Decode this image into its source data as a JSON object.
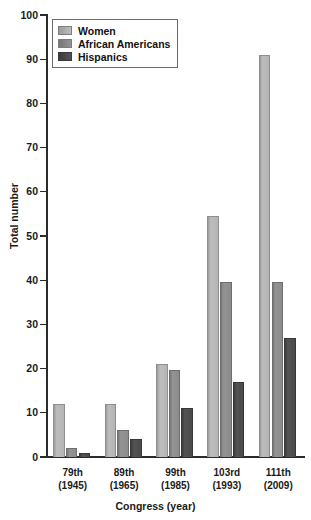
{
  "title_fragment": "",
  "chart_data": {
    "type": "bar",
    "title": "",
    "xlabel": "Congress (year)",
    "ylabel": "Total number",
    "ylim": [
      0,
      100
    ],
    "ytick_step": 10,
    "yticks": [
      0,
      10,
      20,
      30,
      40,
      50,
      60,
      70,
      80,
      90,
      100
    ],
    "grid": false,
    "legend_position": "top-left",
    "categories": [
      "79th (1945)",
      "89th (1965)",
      "99th (1985)",
      "103rd (1993)",
      "111th (2009)"
    ],
    "category_lines": [
      [
        "79th",
        "(1945)"
      ],
      [
        "89th",
        "(1965)"
      ],
      [
        "99th",
        "(1985)"
      ],
      [
        "103rd",
        "(1993)"
      ],
      [
        "111th",
        "(2009)"
      ]
    ],
    "series": [
      {
        "name": "Women",
        "color": "#b4b4b4",
        "values": [
          12,
          12,
          21,
          54.5,
          91
        ]
      },
      {
        "name": "African Americans",
        "color": "#8b8b8b",
        "values": [
          2,
          6,
          19.7,
          39.5,
          39.5
        ]
      },
      {
        "name": "Hispanics",
        "color": "#4a4a4a",
        "values": [
          1,
          4,
          11,
          17,
          27
        ]
      }
    ]
  },
  "legend": {
    "items": [
      {
        "label": "Women"
      },
      {
        "label": "African Americans"
      },
      {
        "label": "Hispanics"
      }
    ]
  }
}
